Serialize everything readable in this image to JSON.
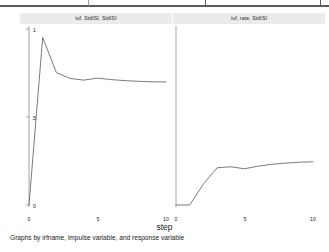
{
  "window": {
    "background_color": "#ffffff",
    "top_rule_color": "#5a5a5a"
  },
  "figure": {
    "step_axis_label": "step",
    "caption": "Graphs by irfname, impulse variable, and response variable",
    "line_color": "#6b6b6b",
    "axis_color": "#8c8c8c",
    "title_bar_color": "#ebebeb"
  },
  "panels": [
    {
      "id": "panel-left",
      "title": "iuf, StdISI, StdISI",
      "y_ticks": [
        "1",
        ".5",
        "0"
      ],
      "x_ticks": [
        "0",
        "5",
        "10"
      ]
    },
    {
      "id": "panel-right",
      "title": "iuf, rate, StdISI",
      "y_ticks": [],
      "x_ticks": [
        "0",
        "5",
        "10"
      ]
    }
  ],
  "chart_data": {
    "type": "line",
    "title": "",
    "xlabel": "step",
    "ylabel": "",
    "xlim": [
      0,
      10
    ],
    "ylim": [
      0,
      1.05
    ],
    "grid": false,
    "legend": "none",
    "subplots": [
      {
        "name": "iuf, StdISI, StdISI",
        "x": [
          0,
          1,
          2,
          3,
          4,
          5,
          6,
          7,
          8,
          9,
          10
        ],
        "y": [
          0.0,
          1.0,
          0.79,
          0.755,
          0.745,
          0.757,
          0.748,
          0.742,
          0.738,
          0.735,
          0.734
        ]
      },
      {
        "name": "iuf, rate, StdISI",
        "x": [
          0,
          1,
          2,
          3,
          4,
          5,
          6,
          7,
          8,
          9,
          10
        ],
        "y": [
          0.0,
          0.0,
          0.125,
          0.222,
          0.228,
          0.216,
          0.232,
          0.243,
          0.25,
          0.255,
          0.258
        ]
      }
    ]
  }
}
